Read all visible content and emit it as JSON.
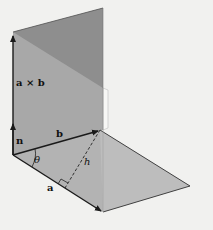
{
  "diagram": {
    "labels": {
      "cross_product": "a × b",
      "normal": "n",
      "vector_b": "b",
      "vector_a": "a",
      "angle": "θ",
      "height": "h"
    },
    "colors": {
      "background": "#f1f1ef",
      "upper_plane": "#8f8f8f",
      "lower_vertical_plane": "#a9a9a9",
      "parallelogram": "#b3b3b3",
      "edge": "#1a1a1a"
    }
  }
}
